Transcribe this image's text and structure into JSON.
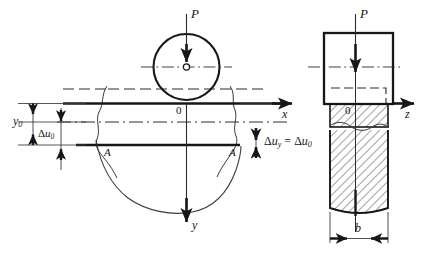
{
  "figure": {
    "colors": {
      "ink": "#15171a",
      "line": "#2b2b2b",
      "thin": "#4a4a4a",
      "background": "#ffffff"
    }
  },
  "labels": {
    "load_left": "P",
    "load_right": "P",
    "origin_left": "0",
    "origin_right": "0",
    "axis_y": "y",
    "axis_x": "x",
    "axis_z": "z",
    "section_left": "A",
    "section_right": "A",
    "dim_y0": "y",
    "dim_y0_sub": "0",
    "dim_du0_delta": "Δ",
    "dim_du0_u": "u",
    "dim_du0_sub": "0",
    "equation_delta": "Δ",
    "equation_u": "u",
    "equation_sub_y": "y",
    "equation_equals": "=",
    "equation_delta2": "Δ",
    "equation_u2": "u",
    "equation_sub_0": "0",
    "dim_b": "b"
  },
  "elements": {
    "wheel": "circle-roller",
    "plate": "elastic-half-space-plate",
    "deflection_bowl": "settlement-curve",
    "hatched_column": "section-hatched-column",
    "break_line_left": "wavy-break-line",
    "break_line_right": "wavy-break-line"
  }
}
